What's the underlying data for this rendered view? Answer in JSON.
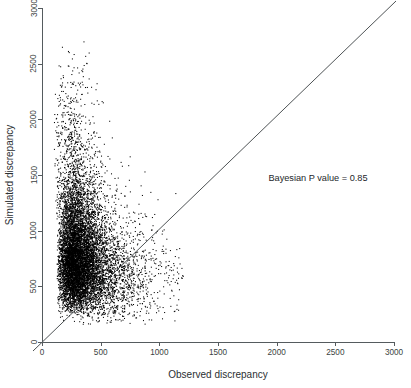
{
  "chart_data": {
    "type": "scatter",
    "title": "",
    "xlabel": "Observed discrepancy",
    "ylabel": "Simulated discrepancy",
    "xlim": [
      0,
      3000
    ],
    "ylim": [
      0,
      3000
    ],
    "xticks": [
      0,
      500,
      1000,
      1500,
      2000,
      2500,
      3000
    ],
    "yticks": [
      0,
      500,
      1000,
      1500,
      2000,
      2500,
      3000
    ],
    "xticklabels": [
      "0",
      "500",
      "1000",
      "1500",
      "2000",
      "2500",
      "3000"
    ],
    "yticklabels": [
      "0",
      "500",
      "1000",
      "1500",
      "2000",
      "2500",
      "3000"
    ],
    "grid": false,
    "legend": null,
    "point_color": "#000000",
    "point_size": 0.6,
    "reference_line": {
      "kind": "identity",
      "equation": "y = x",
      "slope": 1,
      "intercept": 0,
      "color": "#3a3f42"
    },
    "annotations": [
      {
        "text": "Bayesian P value =  0.85",
        "x": 2370,
        "y": 1470
      }
    ],
    "statistic": {
      "label": "Bayesian P value",
      "value": "0.85"
    },
    "cloud": {
      "n_points_drawn": 9000,
      "core_x_range": [
        60,
        620
      ],
      "core_y_range": [
        120,
        1450
      ],
      "tail_x_max": 1200,
      "tail_y_max": 2850
    }
  },
  "axes": {
    "x_axis_name": "x-axis",
    "y_axis_name": "y-axis"
  }
}
